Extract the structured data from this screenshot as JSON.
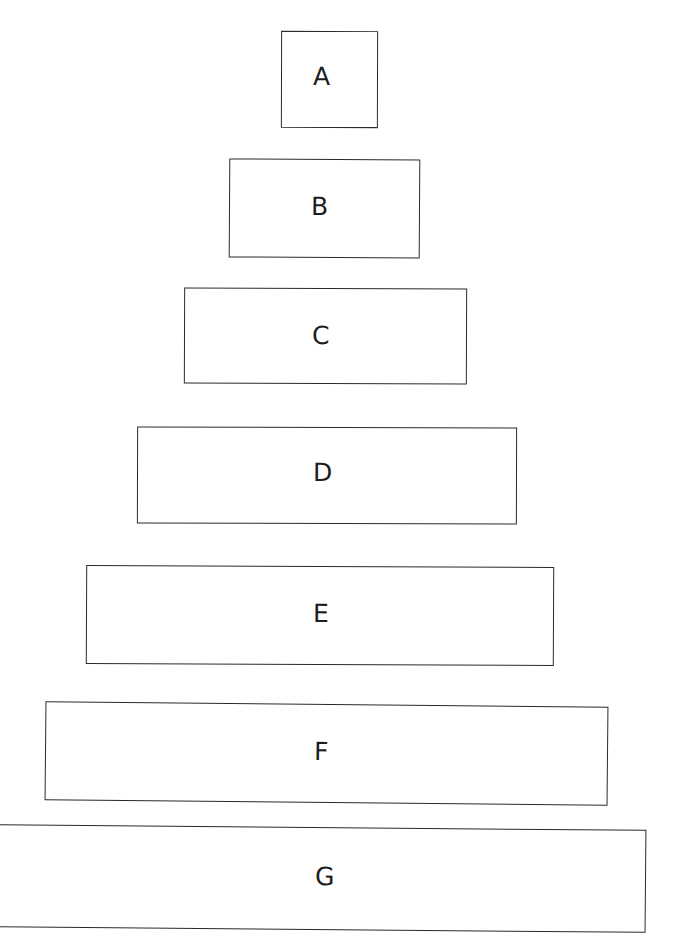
{
  "diagram": {
    "type": "stacked-pyramid",
    "title": "",
    "background_color": "#ffffff",
    "stroke_color": "#2b2b2b",
    "label_color": "#1d1d1d",
    "style": "hand-drawn",
    "level_count": 7,
    "levels": [
      {
        "id": "a",
        "label": "A",
        "rank": 1,
        "x": 281,
        "y": 31,
        "width": 97,
        "height": 97
      },
      {
        "id": "b",
        "label": "B",
        "rank": 2,
        "x": 229,
        "y": 159,
        "width": 191,
        "height": 99
      },
      {
        "id": "c",
        "label": "C",
        "rank": 3,
        "x": 184,
        "y": 288,
        "width": 283,
        "height": 96
      },
      {
        "id": "d",
        "label": "D",
        "rank": 4,
        "x": 137,
        "y": 427,
        "width": 380,
        "height": 97
      },
      {
        "id": "e",
        "label": "E",
        "rank": 5,
        "x": 86,
        "y": 566,
        "width": 468,
        "height": 99
      },
      {
        "id": "f",
        "label": "F",
        "rank": 6,
        "x": 45,
        "y": 704,
        "width": 563,
        "height": 99
      },
      {
        "id": "g",
        "label": "G",
        "rank": 7,
        "x": -8,
        "y": 827,
        "width": 654,
        "height": 103
      }
    ]
  },
  "chart_data": {
    "type": "bar",
    "title": "",
    "xlabel": "",
    "ylabel": "",
    "orientation": "horizontal-centered",
    "grid": false,
    "legend": false,
    "categories": [
      "A",
      "B",
      "C",
      "D",
      "E",
      "F",
      "G"
    ],
    "values": [
      97,
      191,
      283,
      380,
      468,
      563,
      654
    ],
    "value_unit": "px width",
    "xlim": [
      0,
      685
    ]
  }
}
